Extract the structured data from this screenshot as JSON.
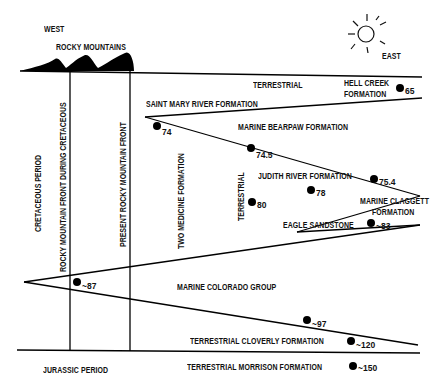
{
  "directions": {
    "west": "WEST",
    "east": "EAST"
  },
  "mountains": {
    "label": "ROCKY MOUNTAINS"
  },
  "periods": {
    "cretaceous": "CRETACEOUS PERIOD",
    "jurassic": "JURASSIC PERIOD"
  },
  "fronts": {
    "cretaceous_front": "ROCKY MOUNTAIN FRONT DURING CRETACEOUS",
    "present_front": "PRESENT ROCKY MOUNTAIN FRONT"
  },
  "formations": {
    "terrestrial_top": "TERRESTRIAL",
    "hell_creek_1": "HELL CREEK",
    "hell_creek_2": "FORMATION",
    "saint_mary": "SAINT MARY RIVER FORMATION",
    "bearpaw": "MARINE BEARPAW FORMATION",
    "two_medicine": "TWO MEDICINE FORMATION",
    "terrestrial_mid": "TERRESTRIAL",
    "judith_river": "JUDITH RIVER FORMATION",
    "claggett_1": "MARINE CLAGGETT",
    "claggett_2": "FORMATION",
    "eagle": "EAGLE SANDSTONE",
    "colorado": "MARINE COLORADO GROUP",
    "cloverly": "TERRESTRIAL CLOVERLY FORMATION",
    "morrison": "TERRESTRIAL MORRISON FORMATION"
  },
  "ages": {
    "a65": "65",
    "a74": "74",
    "a74_5": "74.5",
    "a75_4": "75.4",
    "a78": "78",
    "a80": "80",
    "a83": "~83",
    "a87": "~87",
    "a97": "~97",
    "a120": "~120",
    "a150": "~150"
  }
}
